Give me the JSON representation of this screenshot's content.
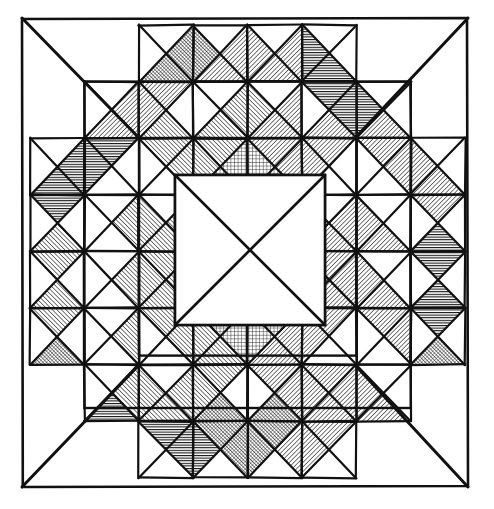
{
  "figure": {
    "kind": "geometric-pattern",
    "medium": "ink-line-drawing",
    "background_color": "#ffffff",
    "ink_color": "#111111"
  },
  "canvas": {
    "width": 494,
    "height": 509
  },
  "frame": {
    "name": "outer-border",
    "x": 22,
    "y": 18,
    "width": 446,
    "height": 469,
    "stroke_width": 2.6,
    "stroke_color": "#111111",
    "fill": "none",
    "corner_wobble": 2
  },
  "grid": {
    "name": "quilt-grid",
    "origin_x": 30,
    "origin_y": 25,
    "cols": 8,
    "rows": 8,
    "cell_width": 54.4,
    "cell_height": 56.6,
    "stroke_width": 2.2,
    "stroke_color": "#111111",
    "draw_cell_outlines": false
  },
  "corner_diagonals": {
    "name": "frame-corner-diagonals",
    "stroke_width": 3.0,
    "segments": [
      {
        "name": "top-left-diagonal",
        "x1": 22,
        "y1": 18,
        "x2": 139,
        "y2": 138
      },
      {
        "name": "top-right-diagonal",
        "x1": 468,
        "y1": 18,
        "x2": 355,
        "y2": 138
      },
      {
        "name": "bottom-left-diagonal",
        "x1": 22,
        "y1": 487,
        "x2": 139,
        "y2": 365
      },
      {
        "name": "bottom-right-diagonal",
        "x1": 468,
        "y1": 487,
        "x2": 355,
        "y2": 365
      }
    ]
  },
  "patterns": {
    "blank": {
      "label": "blank",
      "description": "unfilled white triangle"
    },
    "hatch-right": {
      "label": "hatch-right",
      "description": "diagonal lines rising to the right",
      "angle": 45,
      "spacing": 3.2,
      "stroke_width": 1.15
    },
    "hatch-left": {
      "label": "hatch-left",
      "description": "diagonal lines falling to the right",
      "angle": -45,
      "spacing": 3.2,
      "stroke_width": 1.15
    },
    "cross": {
      "label": "cross",
      "description": "fine square cross-hatch grid",
      "spacing": 3.6,
      "stroke_width": 0.85
    },
    "horiz": {
      "label": "horiz",
      "description": "close horizontal ruling",
      "spacing": 2.6,
      "stroke_width": 1.3
    },
    "dense": {
      "label": "dense",
      "description": "dense diagonal cross-hatch / stipple",
      "spacing": 2.6,
      "stroke_width": 1.1
    }
  },
  "legend": {
    "pattern_order": [
      "blank",
      "hatch-right",
      "hatch-left",
      "cross",
      "horiz",
      "dense"
    ],
    "count_cells": 64,
    "triangles_per_cell": 4,
    "triangle_keys": [
      "N",
      "E",
      "S",
      "W"
    ]
  },
  "cells": [
    {
      "r": 0,
      "c": 0,
      "N": "blank",
      "E": "blank",
      "S": "blank",
      "W": "blank",
      "split": "none"
    },
    {
      "r": 0,
      "c": 1,
      "N": "blank",
      "E": "blank",
      "S": "blank",
      "W": "blank",
      "split": "none"
    },
    {
      "r": 0,
      "c": 2,
      "N": "blank",
      "E": "dense",
      "S": "dense",
      "W": "blank",
      "split": "x"
    },
    {
      "r": 0,
      "c": 3,
      "N": "blank",
      "E": "hatch-left",
      "S": "hatch-left",
      "W": "dense",
      "split": "x"
    },
    {
      "r": 0,
      "c": 4,
      "N": "blank",
      "E": "hatch-left",
      "S": "hatch-left",
      "W": "hatch-left",
      "split": "x"
    },
    {
      "r": 0,
      "c": 5,
      "N": "blank",
      "E": "blank",
      "S": "horiz",
      "W": "horiz",
      "split": "x"
    },
    {
      "r": 0,
      "c": 6,
      "N": "blank",
      "E": "blank",
      "S": "blank",
      "W": "blank",
      "split": "none"
    },
    {
      "r": 0,
      "c": 7,
      "N": "blank",
      "E": "blank",
      "S": "blank",
      "W": "blank",
      "split": "none"
    },
    {
      "r": 1,
      "c": 0,
      "N": "blank",
      "E": "blank",
      "S": "blank",
      "W": "blank",
      "split": "none"
    },
    {
      "r": 1,
      "c": 1,
      "N": "blank",
      "E": "hatch-left",
      "S": "hatch-left",
      "W": "blank",
      "split": "x"
    },
    {
      "r": 1,
      "c": 2,
      "N": "hatch-left",
      "E": "blank",
      "S": "hatch-right",
      "W": "hatch-left",
      "split": "x"
    },
    {
      "r": 1,
      "c": 3,
      "N": "blank",
      "E": "hatch-right",
      "S": "hatch-right",
      "W": "blank",
      "split": "x"
    },
    {
      "r": 1,
      "c": 4,
      "N": "blank",
      "E": "hatch-left",
      "S": "hatch-left",
      "W": "hatch-right",
      "split": "x"
    },
    {
      "r": 1,
      "c": 5,
      "N": "horiz",
      "E": "horiz",
      "S": "hatch-left",
      "W": "blank",
      "split": "x"
    },
    {
      "r": 1,
      "c": 6,
      "N": "blank",
      "E": "blank",
      "S": "hatch-left",
      "W": "horiz",
      "split": "x"
    },
    {
      "r": 1,
      "c": 7,
      "N": "blank",
      "E": "blank",
      "S": "blank",
      "W": "blank",
      "split": "none"
    },
    {
      "r": 2,
      "c": 0,
      "N": "blank",
      "E": "horiz",
      "S": "horiz",
      "W": "blank",
      "split": "x"
    },
    {
      "r": 2,
      "c": 1,
      "N": "horiz",
      "E": "blank",
      "S": "blank",
      "W": "horiz",
      "split": "x"
    },
    {
      "r": 2,
      "c": 2,
      "N": "hatch-right",
      "E": "hatch-right",
      "S": "blank",
      "W": "blank",
      "split": "x"
    },
    {
      "r": 2,
      "c": 3,
      "N": "hatch-right",
      "E": "cross",
      "S": "cross",
      "W": "hatch-right",
      "split": "x"
    },
    {
      "r": 2,
      "c": 4,
      "N": "hatch-left",
      "E": "hatch-left",
      "S": "cross",
      "W": "cross",
      "split": "x"
    },
    {
      "r": 2,
      "c": 5,
      "N": "hatch-left",
      "E": "blank",
      "S": "blank",
      "W": "hatch-left",
      "split": "x"
    },
    {
      "r": 2,
      "c": 6,
      "N": "hatch-left",
      "E": "hatch-left",
      "S": "blank",
      "W": "blank",
      "split": "x"
    },
    {
      "r": 2,
      "c": 7,
      "N": "blank",
      "E": "blank",
      "S": "hatch-left",
      "W": "hatch-left",
      "split": "x"
    },
    {
      "r": 3,
      "c": 0,
      "N": "horiz",
      "E": "blank",
      "S": "hatch-right",
      "W": "blank",
      "split": "x"
    },
    {
      "r": 3,
      "c": 1,
      "N": "blank",
      "E": "hatch-right",
      "S": "blank",
      "W": "blank",
      "split": "x"
    },
    {
      "r": 3,
      "c": 2,
      "N": "blank",
      "E": "hatch-right",
      "S": "hatch-right",
      "W": "hatch-right",
      "split": "x"
    },
    {
      "r": 3,
      "c": 3,
      "N": "cross",
      "E": "blank",
      "S": "blank",
      "W": "cross",
      "split": "x"
    },
    {
      "r": 3,
      "c": 4,
      "N": "cross",
      "E": "cross",
      "S": "blank",
      "W": "blank",
      "split": "x"
    },
    {
      "r": 3,
      "c": 5,
      "N": "blank",
      "E": "hatch-left",
      "S": "hatch-left",
      "W": "hatch-left",
      "split": "x"
    },
    {
      "r": 3,
      "c": 6,
      "N": "blank",
      "E": "blank",
      "S": "hatch-left",
      "W": "hatch-left",
      "split": "x"
    },
    {
      "r": 3,
      "c": 7,
      "N": "hatch-left",
      "E": "blank",
      "S": "horiz",
      "W": "blank",
      "split": "x"
    },
    {
      "r": 4,
      "c": 0,
      "N": "hatch-right",
      "E": "blank",
      "S": "hatch-right",
      "W": "blank",
      "split": "x"
    },
    {
      "r": 4,
      "c": 1,
      "N": "blank",
      "E": "hatch-right",
      "S": "blank",
      "W": "blank",
      "split": "x"
    },
    {
      "r": 4,
      "c": 2,
      "N": "hatch-right",
      "E": "hatch-right",
      "S": "hatch-right",
      "W": "hatch-right",
      "split": "x"
    },
    {
      "r": 4,
      "c": 3,
      "N": "cross",
      "E": "blank",
      "S": "cross",
      "W": "cross",
      "split": "x"
    },
    {
      "r": 4,
      "c": 4,
      "N": "cross",
      "E": "cross",
      "S": "cross",
      "W": "blank",
      "split": "x"
    },
    {
      "r": 4,
      "c": 5,
      "N": "hatch-left",
      "E": "hatch-left",
      "S": "hatch-left",
      "W": "hatch-left",
      "split": "x"
    },
    {
      "r": 4,
      "c": 6,
      "N": "blank",
      "E": "blank",
      "S": "hatch-left",
      "W": "hatch-left",
      "split": "x"
    },
    {
      "r": 4,
      "c": 7,
      "N": "horiz",
      "E": "blank",
      "S": "horiz",
      "W": "blank",
      "split": "x"
    },
    {
      "r": 5,
      "c": 0,
      "N": "hatch-right",
      "E": "blank",
      "S": "dense",
      "W": "blank",
      "split": "x"
    },
    {
      "r": 5,
      "c": 1,
      "N": "blank",
      "E": "hatch-right",
      "S": "blank",
      "W": "blank",
      "split": "x"
    },
    {
      "r": 5,
      "c": 2,
      "N": "hatch-right",
      "E": "hatch-right",
      "S": "blank",
      "W": "blank",
      "split": "x"
    },
    {
      "r": 5,
      "c": 3,
      "N": "cross",
      "E": "cross",
      "S": "hatch-right",
      "W": "hatch-right",
      "split": "x"
    },
    {
      "r": 5,
      "c": 4,
      "N": "cross",
      "E": "hatch-left",
      "S": "hatch-left",
      "W": "cross",
      "split": "x"
    },
    {
      "r": 5,
      "c": 5,
      "N": "hatch-left",
      "E": "blank",
      "S": "blank",
      "W": "hatch-left",
      "split": "x"
    },
    {
      "r": 5,
      "c": 6,
      "N": "hatch-left",
      "E": "hatch-left",
      "S": "blank",
      "W": "blank",
      "split": "x"
    },
    {
      "r": 5,
      "c": 7,
      "N": "horiz",
      "E": "blank",
      "S": "dense",
      "W": "blank",
      "split": "x"
    },
    {
      "r": 6,
      "c": 0,
      "N": "blank",
      "E": "blank",
      "S": "blank",
      "W": "blank",
      "split": "none"
    },
    {
      "r": 6,
      "c": 1,
      "N": "blank",
      "E": "hatch-right",
      "S": "horiz",
      "W": "blank",
      "split": "x"
    },
    {
      "r": 6,
      "c": 2,
      "N": "blank",
      "E": "hatch-right",
      "S": "hatch-right",
      "W": "hatch-right",
      "split": "x"
    },
    {
      "r": 6,
      "c": 3,
      "N": "hatch-right",
      "E": "blank",
      "S": "dense",
      "W": "hatch-right",
      "split": "x"
    },
    {
      "r": 6,
      "c": 4,
      "N": "hatch-left",
      "E": "hatch-left",
      "S": "dense",
      "W": "blank",
      "split": "x"
    },
    {
      "r": 6,
      "c": 5,
      "N": "hatch-left",
      "E": "hatch-left",
      "S": "hatch-left",
      "W": "hatch-left",
      "split": "x"
    },
    {
      "r": 6,
      "c": 6,
      "N": "blank",
      "E": "blank",
      "S": "hatch-left",
      "W": "hatch-left",
      "split": "x"
    },
    {
      "r": 6,
      "c": 7,
      "N": "blank",
      "E": "blank",
      "S": "blank",
      "W": "blank",
      "split": "none"
    },
    {
      "r": 7,
      "c": 0,
      "N": "blank",
      "E": "blank",
      "S": "blank",
      "W": "blank",
      "split": "none"
    },
    {
      "r": 7,
      "c": 1,
      "N": "blank",
      "E": "blank",
      "S": "blank",
      "W": "blank",
      "split": "none"
    },
    {
      "r": 7,
      "c": 2,
      "N": "horiz",
      "E": "horiz",
      "S": "blank",
      "W": "blank",
      "split": "x"
    },
    {
      "r": 7,
      "c": 3,
      "N": "dense",
      "E": "dense",
      "S": "blank",
      "W": "horiz",
      "split": "x"
    },
    {
      "r": 7,
      "c": 4,
      "N": "dense",
      "E": "hatch-left",
      "S": "blank",
      "W": "dense",
      "split": "x"
    },
    {
      "r": 7,
      "c": 5,
      "N": "hatch-left",
      "E": "blank",
      "S": "blank",
      "W": "hatch-left",
      "split": "x"
    },
    {
      "r": 7,
      "c": 6,
      "N": "blank",
      "E": "blank",
      "S": "blank",
      "W": "blank",
      "split": "none"
    },
    {
      "r": 7,
      "c": 7,
      "N": "blank",
      "E": "blank",
      "S": "blank",
      "W": "blank",
      "split": "none"
    }
  ],
  "inner_rings": {
    "name": "concentric-square-outlines",
    "stroke_width": 2.4,
    "squares": [
      {
        "name": "ring-outer",
        "x": 84.4,
        "y": 81.6,
        "size": 326.4
      },
      {
        "name": "ring-middle",
        "x": 139,
        "y": 138,
        "size": 217.6
      },
      {
        "name": "ring-inner",
        "x": 175,
        "y": 175,
        "size": 150
      }
    ]
  },
  "center": {
    "name": "center-medallion",
    "x": 175,
    "y": 175,
    "size": 150,
    "diagonals": true,
    "fill": "blank",
    "stroke_width": 2.6
  }
}
